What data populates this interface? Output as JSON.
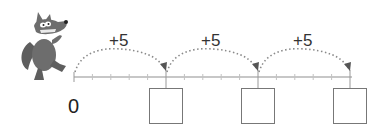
{
  "number_line": {
    "start_label": "0",
    "tick_spacing_units": 1,
    "ticks_per_jump": 5,
    "visible_range": [
      0,
      15
    ]
  },
  "jumps": [
    {
      "label": "+5",
      "from": 0,
      "to": 5
    },
    {
      "label": "+5",
      "from": 5,
      "to": 10
    },
    {
      "label": "+5",
      "from": 10,
      "to": 15
    }
  ],
  "answer_boxes": [
    {
      "position": 5,
      "value": ""
    },
    {
      "position": 10,
      "value": ""
    },
    {
      "position": 15,
      "value": ""
    }
  ],
  "character": {
    "icon": "wolf-icon"
  },
  "colors": {
    "line": "#b5b5b5",
    "arc": "#8a8a8a",
    "arrowhead": "#555555",
    "box_border": "#777777",
    "wolf": "#6a6a6a"
  }
}
